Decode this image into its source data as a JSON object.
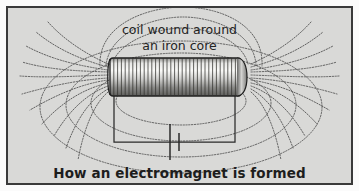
{
  "figure": {
    "kind": "physics-diagram",
    "caption": "How an electromagnet is formed",
    "background_color": "#d9d9d7",
    "border_color": "#3a3a3a",
    "ink_color": "#3d3d3d"
  },
  "annotations": {
    "coil_label_line1": "coil wound around",
    "coil_label_line2": "an iron core"
  },
  "diagram": {
    "solenoid": {
      "name": "coil wound around an iron core",
      "left": 108,
      "right": 239,
      "top": 56,
      "bottom": 94,
      "winding_turns": 34,
      "body_light": "#f2f2f0",
      "body_dark": "#6e6e6c",
      "outline": "#1f1f1f"
    },
    "circuit": {
      "left_wire_x": 111,
      "right_wire_x": 232,
      "wire_top_y": 92,
      "wire_bottom_y": 140,
      "battery": {
        "name": "battery-symbol",
        "center_x": 168,
        "long_plate_top": 122,
        "long_plate_bottom": 158,
        "short_plate_top": 131,
        "short_plate_bottom": 149,
        "plate_gap": 9
      },
      "wire_color": "#2a2a2a"
    },
    "field": {
      "radial_lines_per_side": 11,
      "loop_count": 4,
      "top_arc_count": 3,
      "line_color": "#4a4a4a",
      "dash_pattern": "1.3 1.5"
    }
  }
}
